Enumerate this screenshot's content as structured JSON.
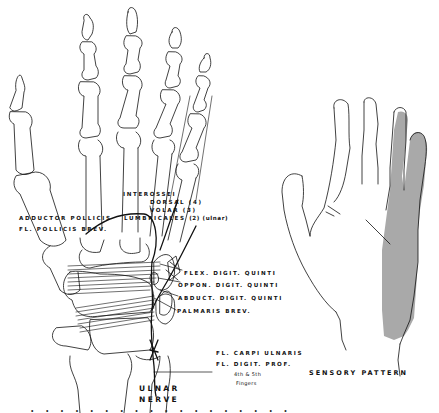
{
  "figure": {
    "left_panel": {
      "subject": "skeletal-hand-palmar-view",
      "labels": {
        "interossei": "INTEROSSEI",
        "dorsal": "DORSAL (4)",
        "volar": "VOLAR  (3)",
        "lumbricales_main": "LUMBRICALES",
        "lumbricales_note": "(2) (ulnar)",
        "adductor_pollicis": "ADDUCTOR POLLICIS",
        "fl_pollicis_brev": "FL. POLLICIS BREV.",
        "flex_digit_quinti": "FLEX. DIGIT. QUINTI",
        "oppon_digit_quinti": "OPPON. DIGIT. QUINTI",
        "abduct_digit_quinti": "ABDUCT. DIGIT. QUINTI",
        "palmaris_brev": "PALMARIS BREV.",
        "fl_carpi_ulnaris": "FL. CARPI ULNARIS",
        "fl_digit_prof": "FL. DIGIT. PROF.",
        "fingers_line1": "4th & 5th",
        "fingers_line2": "Fingers",
        "nerve_line1": "ULNAR",
        "nerve_line2": "NERVE"
      }
    },
    "right_panel": {
      "subject": "hand-outline-sensory-distribution",
      "title": "SENSORY PATTERN",
      "shaded_region": "ulnar side: little finger and ulnar half of ring finger, hypothenar palm"
    },
    "caption_fragment": "· · · · · · · · · · · · · · · · · ·",
    "colors": {
      "background": "#ffffff",
      "line": "#111111",
      "sensory_shade": "#a9a9a9"
    }
  }
}
